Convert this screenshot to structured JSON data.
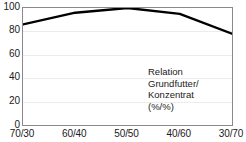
{
  "chart_data": {
    "type": "line",
    "title": "",
    "subtitle": "",
    "xlabel": "",
    "ylabel": "",
    "categories": [
      "70/30",
      "60/40",
      "50/50",
      "40/60",
      "30/70"
    ],
    "x": [
      0,
      1,
      2,
      3,
      4
    ],
    "values": [
      86,
      96,
      100,
      95,
      78
    ],
    "series": [
      {
        "name": "Leistung",
        "values": [
          86,
          96,
          100,
          95,
          78
        ],
        "color": "#000000",
        "line_width": 2.4
      }
    ],
    "xlim": [
      0,
      4
    ],
    "ylim": [
      0,
      100
    ],
    "y_ticks": [
      0,
      20,
      40,
      60,
      80,
      100
    ],
    "y_tick_labels": [
      "0",
      "20",
      "40",
      "60",
      "80",
      "100"
    ],
    "x_tick_labels": [
      "70/30",
      "60/40",
      "50/50",
      "40/60",
      "30/70"
    ],
    "grid": {
      "horizontal": true,
      "vertical": false,
      "color": "#ececec"
    },
    "legend": {
      "show": false,
      "position": "none"
    },
    "annotations": [
      {
        "name": "axis-caption",
        "lines": [
          "Relation",
          "Grundfutter/",
          "Konzentrat",
          "(%/%)"
        ],
        "x_frac": 0.6,
        "y_frac": 0.5
      }
    ],
    "frame": {
      "color": "#8a8a8a",
      "show": true
    },
    "background": "#ffffff"
  },
  "annotation": {
    "line1": "Relation",
    "line2": "Grundfutter/",
    "line3": "Konzentrat",
    "line4": "(%/%)"
  },
  "y_axis": {
    "t0": "0",
    "t1": "20",
    "t2": "40",
    "t3": "60",
    "t4": "80",
    "t5": "100"
  },
  "x_axis": {
    "t0": "70/30",
    "t1": "60/40",
    "t2": "50/50",
    "t3": "40/60",
    "t4": "30/70"
  }
}
